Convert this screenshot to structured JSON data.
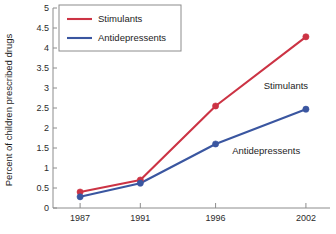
{
  "chart_data": {
    "type": "line",
    "title": "",
    "xlabel": "",
    "ylabel": "Percent of children prescribed drugs",
    "categories": [
      "1987",
      "1991",
      "1996",
      "2002"
    ],
    "x": [
      1987,
      1991,
      1996,
      2002
    ],
    "xlim": [
      1985.2,
      2003.6
    ],
    "ylim": [
      0,
      5
    ],
    "y_ticks": [
      "0",
      "0.5",
      "1",
      "1.5",
      "2",
      "2.5",
      "3",
      "3.5",
      "4",
      "4.5",
      "5"
    ],
    "y_tick_values": [
      0,
      0.5,
      1,
      1.5,
      2,
      2.5,
      3,
      3.5,
      4,
      4.5,
      5
    ],
    "grid": false,
    "legend_position": "top-left",
    "series": [
      {
        "name": "Stimulants",
        "color": "#cc3344",
        "values": [
          0.4,
          0.7,
          2.55,
          4.28
        ],
        "marker": "circle"
      },
      {
        "name": "Antidepressents",
        "color": "#3a56a0",
        "values": [
          0.28,
          0.62,
          1.6,
          2.47
        ],
        "marker": "circle"
      }
    ],
    "annotations": [
      {
        "text": "Stimulants",
        "series": "Stimulants",
        "x": 1999.2,
        "y": 3.05
      },
      {
        "text": "Antidepressents",
        "series": "Antidepressents",
        "x": 1997.1,
        "y": 1.42
      }
    ]
  },
  "legend": {
    "entries": [
      {
        "label": "Stimulants",
        "color": "#cc3344"
      },
      {
        "label": "Antidepressents",
        "color": "#3a56a0"
      }
    ]
  },
  "axes": {
    "y_title": "Percent of children prescribed drugs",
    "x_title": ""
  },
  "colors": {
    "stimulants": "#cc3344",
    "antidepressents": "#3a56a0",
    "axis": "#8c8c8c",
    "text": "#1d1d1d",
    "background": "#ffffff"
  }
}
